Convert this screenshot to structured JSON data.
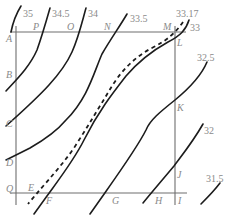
{
  "diagram": {
    "type": "isoline contour map with rectangular frame",
    "contour_labels": [
      "35",
      "34.5",
      "34",
      "33.5",
      "33.17",
      "33",
      "32.5",
      "32",
      "31.5"
    ],
    "point_labels": {
      "A": "A",
      "B": "B",
      "C": "C",
      "D": "D",
      "Q": "Q",
      "E": "E",
      "F": "F",
      "G": "G",
      "H": "H",
      "I": "I",
      "J": "J",
      "K": "K",
      "L": "L",
      "M": "M",
      "N": "N",
      "O": "O",
      "P": "P"
    },
    "dashed_line_label": "33.17",
    "colors": {
      "contour": "#1c1c1c",
      "frame": "#6e6e6e",
      "label": "#8a8a8a"
    }
  }
}
